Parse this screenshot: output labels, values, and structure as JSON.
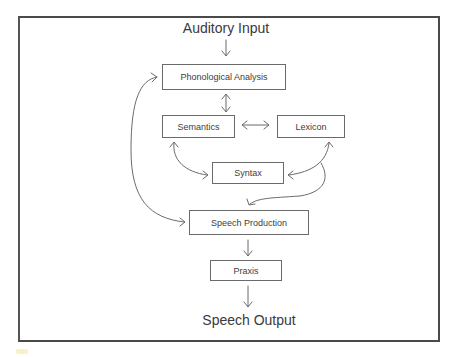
{
  "diagram": {
    "input_label": "Auditory Input",
    "output_label": "Speech Output",
    "nodes": {
      "phonological_analysis": "Phonological Analysis",
      "semantics": "Semantics",
      "lexicon": "Lexicon",
      "syntax": "Syntax",
      "speech_production": "Speech Production",
      "praxis": "Praxis"
    },
    "edges": [
      {
        "from": "Auditory Input",
        "to": "Phonological Analysis",
        "type": "one-way"
      },
      {
        "from": "Phonological Analysis",
        "to": "Semantics",
        "type": "two-way"
      },
      {
        "from": "Semantics",
        "to": "Lexicon",
        "type": "two-way"
      },
      {
        "from": "Semantics",
        "to": "Syntax",
        "type": "two-way"
      },
      {
        "from": "Lexicon",
        "to": "Syntax",
        "type": "two-way"
      },
      {
        "from": "Lexicon",
        "to": "Speech Production",
        "type": "one-way"
      },
      {
        "from": "Speech Production",
        "to": "Phonological Analysis",
        "type": "two-way"
      },
      {
        "from": "Speech Production",
        "to": "Praxis",
        "type": "one-way"
      },
      {
        "from": "Praxis",
        "to": "Speech Output",
        "type": "one-way"
      }
    ],
    "colors": {
      "line": "#5a5a5a",
      "frame": "#4a4a4a",
      "text": "#3a3a3a"
    }
  }
}
